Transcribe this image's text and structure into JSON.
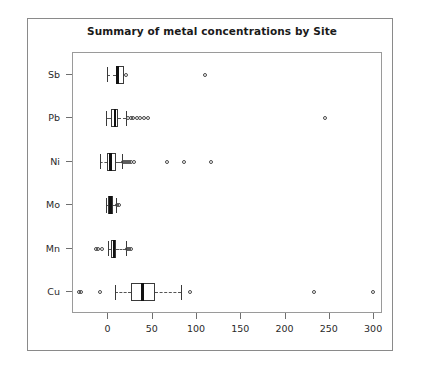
{
  "chart_data": {
    "type": "boxplot",
    "title": "Summary of metal concentrations by Site",
    "xlabel": "",
    "ylabel": "",
    "orientation": "horizontal",
    "grid": false,
    "legend": null,
    "xlim": [
      -40,
      310
    ],
    "xticks": [
      0,
      50,
      100,
      150,
      200,
      250,
      300
    ],
    "xtick_labels": [
      "0",
      "50",
      "100",
      "150",
      "200",
      "250",
      "300"
    ],
    "categories": [
      "Cu",
      "Mn",
      "Mo",
      "Ni",
      "Pb",
      "Sb"
    ],
    "ytick_labels_top_to_bottom": [
      "Sb",
      "Pb",
      "Ni",
      "Mo",
      "Mn",
      "Cu"
    ],
    "boxes": [
      {
        "label": "Sb",
        "whisker_low": -2,
        "q1": 8,
        "median": 10,
        "q3": 18,
        "whisker_high": 17,
        "outliers": [
          20,
          109
        ]
      },
      {
        "label": "Pb",
        "whisker_low": -3,
        "q1": 3,
        "median": 7,
        "q3": 11,
        "whisker_high": 20,
        "outliers": [
          22,
          25,
          28,
          32,
          36,
          40,
          45,
          245
        ]
      },
      {
        "label": "Ni",
        "whisker_low": -9,
        "q1": -2,
        "median": 2,
        "q3": 9,
        "whisker_high": 15,
        "outliers": [
          17,
          19,
          21,
          23,
          26,
          29,
          66,
          85,
          116
        ]
      },
      {
        "label": "Mo",
        "whisker_low": -3,
        "q1": 0,
        "median": 2,
        "q3": 5,
        "whisker_high": 8,
        "outliers": [
          10,
          12
        ]
      },
      {
        "label": "Mn",
        "whisker_low": -1,
        "q1": 3,
        "median": 6,
        "q3": 9,
        "whisker_high": 20,
        "outliers": [
          -14,
          -12,
          -7,
          21,
          23,
          26
        ]
      },
      {
        "label": "Cu",
        "whisker_low": 7,
        "q1": 25,
        "median": 38,
        "q3": 53,
        "whisker_high": 82,
        "outliers": [
          -33,
          -31,
          -10,
          92,
          232,
          299
        ]
      }
    ]
  },
  "colors": {
    "background": "#ffffff",
    "frame": "#8a8a8a",
    "axis": "#6f6f6f",
    "box_stroke": "#3a3a3a",
    "median": "#111111",
    "text": "#1a1a1a"
  }
}
